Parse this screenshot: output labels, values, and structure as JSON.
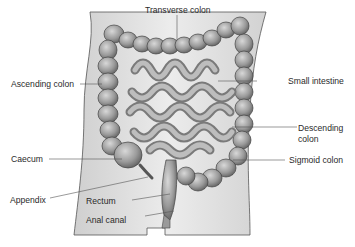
{
  "figure": {
    "type": "anatomical-diagram"
  },
  "labels": {
    "transverse_colon": "Transverse colon",
    "ascending_colon": "Ascending colon",
    "small_intestine": "Small intestine",
    "descending_colon_line1": "Descending",
    "descending_colon_line2": "colon",
    "caecum": "Caecum",
    "sigmoid_colon": "Sigmoid colon",
    "appendix": "Appendix",
    "rectum": "Rectum",
    "anal_canal": "Anal canal"
  },
  "colors": {
    "background": "#ffffff",
    "body_fill": "#e3e3e3",
    "body_outline": "#555555",
    "organ_fill": "#a9a9a9",
    "organ_dark": "#6e6e6e",
    "organ_light": "#cfcfcf",
    "leader_line": "#555555",
    "text": "#2a2a2a"
  }
}
